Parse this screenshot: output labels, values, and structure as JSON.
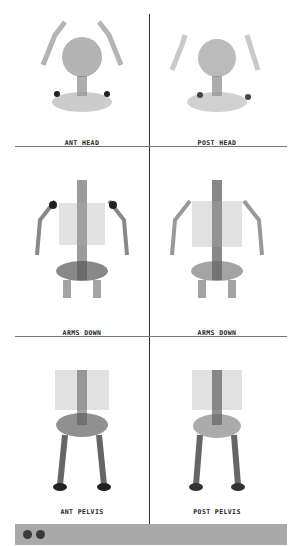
{
  "panels": [
    {
      "row": 0,
      "col": 0,
      "label": "ANT HEAD",
      "view": "anterior",
      "region": "head"
    },
    {
      "row": 0,
      "col": 1,
      "label": "POST HEAD",
      "view": "posterior",
      "region": "head"
    },
    {
      "row": 1,
      "col": 0,
      "label": "ARMS DOWN",
      "view": "anterior",
      "region": "chest"
    },
    {
      "row": 1,
      "col": 1,
      "label": "ARMS DOWN",
      "view": "posterior",
      "region": "chest"
    },
    {
      "row": 2,
      "col": 0,
      "label": "ANT PELVIS",
      "view": "anterior",
      "region": "pelvis"
    },
    {
      "row": 2,
      "col": 1,
      "label": "POST PELVIS",
      "view": "posterior",
      "region": "pelvis"
    }
  ],
  "footer": {
    "indicator_dots": 2,
    "bar_color": "#a9a9a9",
    "dot_color": "#3a3a3a"
  }
}
